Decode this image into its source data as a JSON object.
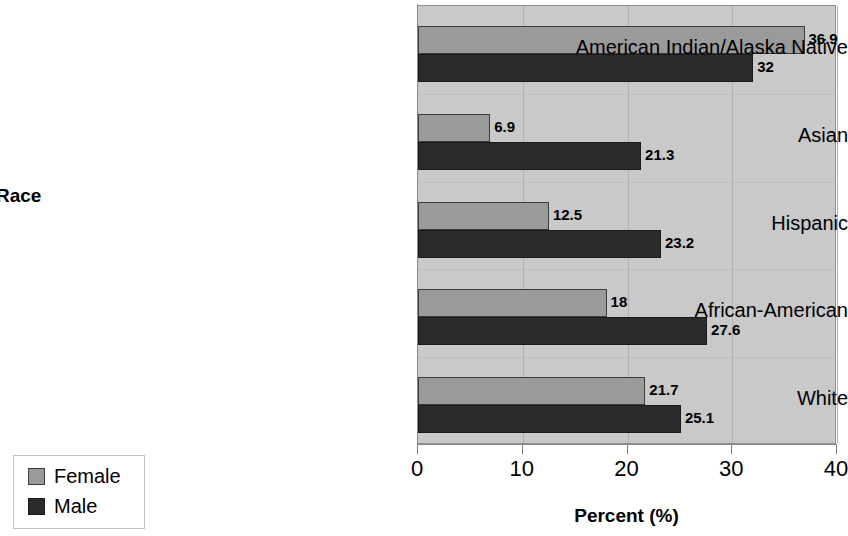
{
  "chart_data": {
    "type": "bar",
    "orientation": "horizontal",
    "title": "",
    "xlabel": "Percent (%)",
    "ylabel": "Race",
    "xlim": [
      0,
      40
    ],
    "xticks": [
      0,
      10,
      20,
      30,
      40
    ],
    "xtick_labels": [
      "0",
      "10",
      "20",
      "30",
      "40"
    ],
    "grid": true,
    "legend_position": "bottom-left",
    "categories": [
      "American Indian/Alaska Native",
      "Asian",
      "Hispanic",
      "African-American",
      "White"
    ],
    "series": [
      {
        "name": "Female",
        "color": "#9a9a9a",
        "values": [
          36.9,
          6.9,
          12.5,
          18,
          21.7
        ],
        "value_labels": [
          "36.9",
          "6.9",
          "12.5",
          "18",
          "21.7"
        ]
      },
      {
        "name": "Male",
        "color": "#2b2b2b",
        "values": [
          32,
          21.3,
          23.2,
          27.6,
          25.1
        ],
        "value_labels": [
          "32",
          "21.3",
          "23.2",
          "27.6",
          "25.1"
        ]
      }
    ]
  },
  "legend": {
    "items": [
      {
        "label": "Female",
        "color": "#9a9a9a"
      },
      {
        "label": "Male",
        "color": "#2b2b2b"
      }
    ]
  },
  "axes": {
    "x_title": "Percent (%)",
    "y_title": "Race"
  },
  "colors": {
    "plot_background": "#c9c9c9",
    "female_bar": "#9a9a9a",
    "male_bar": "#2b2b2b",
    "gridline": "#b0b0b0",
    "page_background": "#ffffff"
  }
}
